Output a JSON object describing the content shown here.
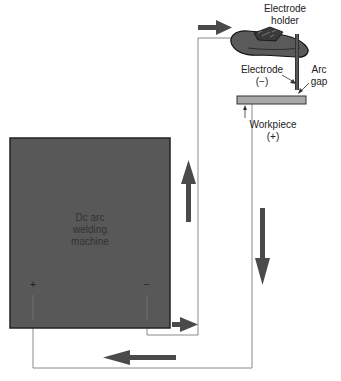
{
  "diagram": {
    "machine": {
      "label_lines": [
        "Dc arc",
        "welding",
        "machine"
      ],
      "plus": "+",
      "minus": "−",
      "fill": "#585858"
    },
    "electrode_holder": {
      "label_lines": [
        "Electrode",
        "holder"
      ]
    },
    "electrode": {
      "label_lines": [
        "Electrode",
        "(−)"
      ]
    },
    "arc_gap": {
      "label_lines": [
        "Arc",
        "gap"
      ]
    },
    "workpiece": {
      "label_lines": [
        "Workpiece",
        "(+)"
      ],
      "fill": "#a8a8a8"
    },
    "arrows": [
      {
        "id": "to-holder",
        "direction": "right"
      },
      {
        "id": "up-inner",
        "direction": "up"
      },
      {
        "id": "down-outer",
        "direction": "down"
      },
      {
        "id": "bottom-left",
        "direction": "left"
      },
      {
        "id": "out-negative",
        "direction": "right"
      }
    ],
    "colors": {
      "wire": "#888888",
      "arrow": "#4a4a4a",
      "machine": "#585858",
      "workpiece": "#a8a8a8"
    }
  }
}
